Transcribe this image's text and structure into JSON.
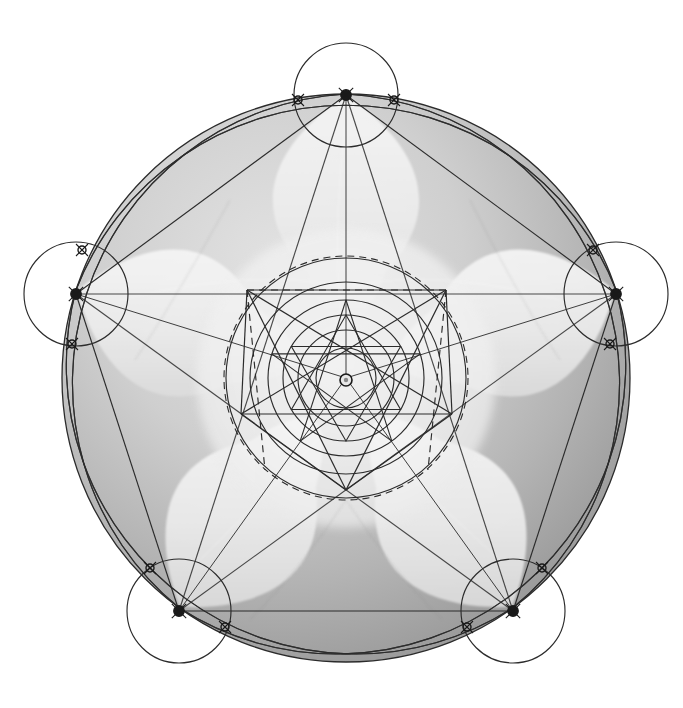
{
  "figure": {
    "background_color": "#ffffff",
    "disk_color_light": "#d8d8d8",
    "disk_color_dark": "#9a9a9a",
    "petal_color": "#efefef",
    "line_color": "#2b2b2b",
    "node_color": "#1a1a1a",
    "canvas": {
      "width": 683,
      "height": 708
    }
  },
  "geometry": {
    "center": {
      "x": 346,
      "y": 378
    },
    "outer_radius": 284,
    "vertex_circle_radius": 52,
    "inner_circles_radii": [
      30,
      48,
      63,
      78,
      96,
      120
    ],
    "center_dot_radius": 6,
    "petal_count": 5,
    "rotation_deg": -90,
    "main_vertices": [
      {
        "label": "top",
        "x": 346,
        "y": 95
      },
      {
        "label": "right",
        "x": 616,
        "y": 294
      },
      {
        "label": "bottom-right",
        "x": 513,
        "y": 611
      },
      {
        "label": "bottom-left",
        "x": 179,
        "y": 611
      },
      {
        "label": "left",
        "x": 76,
        "y": 294
      }
    ],
    "node_markers": [
      {
        "x": 346,
        "y": 95
      },
      {
        "x": 616,
        "y": 294
      },
      {
        "x": 513,
        "y": 611
      },
      {
        "x": 179,
        "y": 611
      },
      {
        "x": 76,
        "y": 294
      },
      {
        "x": 298,
        "y": 100
      },
      {
        "x": 394,
        "y": 100
      },
      {
        "x": 610,
        "y": 344
      },
      {
        "x": 593,
        "y": 250
      },
      {
        "x": 467,
        "y": 627
      },
      {
        "x": 542,
        "y": 568
      },
      {
        "x": 150,
        "y": 568
      },
      {
        "x": 225,
        "y": 627
      },
      {
        "x": 82,
        "y": 250
      },
      {
        "x": 72,
        "y": 344
      }
    ],
    "inner_pentagon_radius": 112,
    "inner_pentagon_vertices": [
      {
        "label": "top-left",
        "x": 247,
        "y": 290
      },
      {
        "label": "top-right",
        "x": 446,
        "y": 290
      },
      {
        "label": "mid-right",
        "x": 452,
        "y": 414
      },
      {
        "label": "bottom",
        "x": 346,
        "y": 490
      },
      {
        "label": "mid-left",
        "x": 241,
        "y": 414
      }
    ],
    "dashed_segments": [
      {
        "from": {
          "x": 247,
          "y": 290
        },
        "to": {
          "x": 446,
          "y": 290
        }
      },
      {
        "from": {
          "x": 247,
          "y": 290
        },
        "to": {
          "x": 265,
          "y": 470
        }
      },
      {
        "from": {
          "x": 446,
          "y": 290
        },
        "to": {
          "x": 428,
          "y": 470
        }
      }
    ],
    "dashed_arc_radius": 122
  },
  "labels": {
    "figure_caption": "",
    "annotations": []
  }
}
